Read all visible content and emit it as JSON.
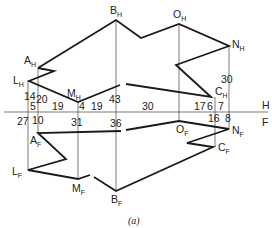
{
  "figure": {
    "caption": "(a)",
    "fold_line_labels": {
      "top": "H",
      "bottom": "F"
    }
  },
  "top_view": {
    "points": {
      "A": {
        "label": "A",
        "sub": "H"
      },
      "B": {
        "label": "B",
        "sub": "H"
      },
      "C": {
        "label": "C",
        "sub": "H"
      },
      "L": {
        "label": "L",
        "sub": "H"
      },
      "M": {
        "label": "M",
        "sub": "H"
      },
      "N": {
        "label": "N",
        "sub": "H"
      },
      "O": {
        "label": "O",
        "sub": "H"
      }
    },
    "dimensions": {
      "d14": "14",
      "d5": "5",
      "d20": "20",
      "d19a": "19",
      "d4": "4",
      "d19b": "19",
      "d43": "43",
      "d30a": "30",
      "d17": "17",
      "d6": "6",
      "d7": "7",
      "d30b": "30"
    }
  },
  "front_view": {
    "points": {
      "A": {
        "label": "A",
        "sub": "F"
      },
      "B": {
        "label": "B",
        "sub": "F"
      },
      "C": {
        "label": "C",
        "sub": "F"
      },
      "L": {
        "label": "L",
        "sub": "F"
      },
      "M": {
        "label": "M",
        "sub": "F"
      },
      "N": {
        "label": "N",
        "sub": "F"
      },
      "O": {
        "label": "O",
        "sub": "F"
      }
    },
    "dimensions": {
      "d27": "27",
      "d10": "10",
      "d31": "31",
      "d36": "36",
      "d16": "16",
      "d8": "8"
    }
  }
}
